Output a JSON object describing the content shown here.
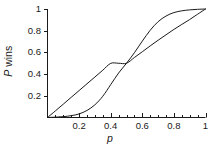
{
  "chart_data": {
    "type": "line",
    "title": "",
    "subtitle": "",
    "xlabel": "p",
    "ylabel": "P wins",
    "xlim": [
      0,
      1
    ],
    "ylim": [
      0,
      1
    ],
    "grid": false,
    "legend": "none",
    "background_color": "#ffffff",
    "line_color": "#1a1a1a",
    "axis_color": "#1a1a1a",
    "x_ticks": [
      0.2,
      0.4,
      0.6,
      0.8,
      1
    ],
    "x_tick_labels": [
      "0.2",
      "0.4",
      "0.6",
      "0.8",
      "1"
    ],
    "x_minor_ticks": [
      0.05,
      0.1,
      0.15,
      0.25,
      0.3,
      0.35,
      0.45,
      0.5,
      0.55,
      0.65,
      0.7,
      0.75,
      0.85,
      0.9,
      0.95
    ],
    "y_ticks": [
      0.2,
      0.4,
      0.6,
      0.8,
      1
    ],
    "y_tick_labels": [
      "0.2",
      "0.4",
      "0.6",
      "0.8",
      "1"
    ],
    "annotations": [],
    "crossing_point": [
      0.5,
      0.5
    ],
    "series": [
      {
        "name": "near-diagonal",
        "x": [
          0,
          0.05,
          0.1,
          0.15,
          0.2,
          0.25,
          0.3,
          0.35,
          0.4,
          0.45,
          0.5,
          0.55,
          0.6,
          0.65,
          0.7,
          0.75,
          0.8,
          0.85,
          0.9,
          0.95,
          1
        ],
        "y": [
          0,
          0.061,
          0.123,
          0.186,
          0.248,
          0.311,
          0.373,
          0.436,
          0.499,
          0.5,
          0.5,
          0.553,
          0.606,
          0.66,
          0.712,
          0.762,
          0.812,
          0.858,
          0.903,
          0.952,
          1
        ]
      },
      {
        "name": "sigmoid",
        "x": [
          0,
          0.05,
          0.1,
          0.15,
          0.2,
          0.25,
          0.3,
          0.35,
          0.4,
          0.45,
          0.5,
          0.55,
          0.6,
          0.65,
          0.7,
          0.75,
          0.8,
          0.85,
          0.9,
          0.95,
          1
        ],
        "y": [
          0,
          0.003,
          0.008,
          0.017,
          0.033,
          0.065,
          0.117,
          0.196,
          0.303,
          0.41,
          0.5,
          0.597,
          0.704,
          0.804,
          0.883,
          0.935,
          0.967,
          0.983,
          0.992,
          0.997,
          1
        ]
      }
    ]
  }
}
